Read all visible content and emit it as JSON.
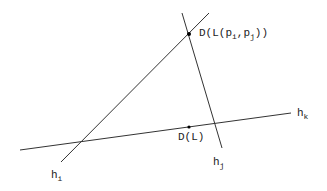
{
  "diagram": {
    "lines": [
      {
        "id": "h_i",
        "label": "h",
        "sub": "i"
      },
      {
        "id": "h_j",
        "label": "h",
        "sub": "j"
      },
      {
        "id": "h_k",
        "label": "h",
        "sub": "k"
      }
    ],
    "points": [
      {
        "id": "D_Lpipj",
        "label_pre": "D(L(p",
        "sub1": "i",
        "mid": ",p",
        "sub2": "j",
        "post": "))"
      },
      {
        "id": "D_L",
        "label": "D(L)"
      }
    ]
  }
}
